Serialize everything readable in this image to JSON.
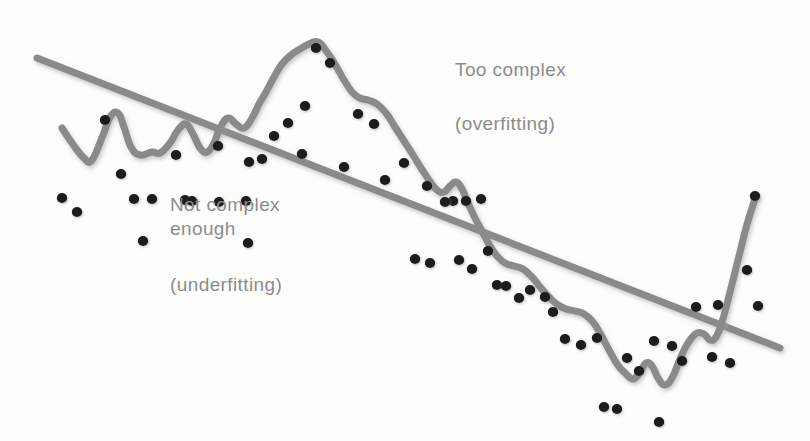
{
  "figure": {
    "background_color": "#fdfdfc"
  },
  "annotations": {
    "too_complex": "Too complex",
    "overfitting": "(overfitting)",
    "not_complex_enough_line1": "Not complex",
    "not_complex_enough_line2": "enough",
    "underfitting": "(underfitting)"
  },
  "style": {
    "curve_color": "#8a8a8a",
    "line_color": "#8a8a8a",
    "point_color": "#1a1a1a",
    "text_color": "#8c8c8c",
    "stroke_width": 7,
    "point_radius": 5.2
  },
  "chart_data": {
    "type": "scatter",
    "title": "",
    "xlabel": "",
    "ylabel": "",
    "xlim": [
      0,
      810
    ],
    "ylim": [
      441,
      0
    ],
    "grid": false,
    "legend": false,
    "axes_visible": false,
    "series": [
      {
        "name": "data points",
        "type": "scatter",
        "color": "#1a1a1a",
        "points": [
          [
            62,
            198
          ],
          [
            77,
            212
          ],
          [
            121,
            174
          ],
          [
            134,
            199
          ],
          [
            152,
            199
          ],
          [
            105,
            120
          ],
          [
            143,
            241
          ],
          [
            176,
            155
          ],
          [
            185,
            200
          ],
          [
            192,
            201
          ],
          [
            218,
            146
          ],
          [
            219,
            202
          ],
          [
            249,
            162
          ],
          [
            246,
            201
          ],
          [
            248,
            243
          ],
          [
            262,
            159
          ],
          [
            274,
            136
          ],
          [
            288,
            123
          ],
          [
            302,
            154
          ],
          [
            305,
            106
          ],
          [
            316,
            48
          ],
          [
            330,
            63
          ],
          [
            358,
            114
          ],
          [
            374,
            124
          ],
          [
            344,
            167
          ],
          [
            385,
            180
          ],
          [
            404,
            163
          ],
          [
            427,
            186
          ],
          [
            430,
            263
          ],
          [
            453,
            201
          ],
          [
            459,
            260
          ],
          [
            472,
            269
          ],
          [
            415,
            259
          ],
          [
            466,
            201
          ],
          [
            445,
            202
          ],
          [
            481,
            199
          ],
          [
            488,
            251
          ],
          [
            497,
            285
          ],
          [
            506,
            286
          ],
          [
            519,
            298
          ],
          [
            530,
            290
          ],
          [
            545,
            297
          ],
          [
            553,
            312
          ],
          [
            565,
            339
          ],
          [
            581,
            345
          ],
          [
            597,
            338
          ],
          [
            604,
            407
          ],
          [
            617,
            409
          ],
          [
            627,
            358
          ],
          [
            639,
            371
          ],
          [
            654,
            341
          ],
          [
            659,
            422
          ],
          [
            672,
            346
          ],
          [
            682,
            361
          ],
          [
            696,
            307
          ],
          [
            712,
            357
          ],
          [
            718,
            305
          ],
          [
            730,
            363
          ],
          [
            747,
            270
          ],
          [
            755,
            196
          ],
          [
            758,
            306
          ]
        ]
      },
      {
        "name": "underfit model (straight line)",
        "type": "line",
        "color": "#8a8a8a",
        "path": [
          [
            37,
            58
          ],
          [
            780,
            348
          ]
        ]
      },
      {
        "name": "overfit model (wiggly curve)",
        "type": "line",
        "color": "#8a8a8a",
        "path": [
          [
            62,
            128
          ],
          [
            72,
            143
          ],
          [
            84,
            158
          ],
          [
            92,
            160
          ],
          [
            103,
            135
          ],
          [
            110,
            117
          ],
          [
            118,
            113
          ],
          [
            124,
            127
          ],
          [
            131,
            147
          ],
          [
            140,
            155
          ],
          [
            152,
            152
          ],
          [
            160,
            153
          ],
          [
            170,
            143
          ],
          [
            178,
            130
          ],
          [
            186,
            124
          ],
          [
            193,
            134
          ],
          [
            200,
            148
          ],
          [
            207,
            152
          ],
          [
            214,
            143
          ],
          [
            220,
            128
          ],
          [
            228,
            118
          ],
          [
            236,
            124
          ],
          [
            244,
            128
          ],
          [
            252,
            118
          ],
          [
            259,
            104
          ],
          [
            266,
            92
          ],
          [
            274,
            77
          ],
          [
            282,
            64
          ],
          [
            291,
            55
          ],
          [
            300,
            49
          ],
          [
            309,
            44
          ],
          [
            318,
            42
          ],
          [
            327,
            52
          ],
          [
            336,
            66
          ],
          [
            344,
            80
          ],
          [
            352,
            92
          ],
          [
            360,
            98
          ],
          [
            368,
            100
          ],
          [
            377,
            104
          ],
          [
            386,
            113
          ],
          [
            395,
            127
          ],
          [
            404,
            141
          ],
          [
            413,
            155
          ],
          [
            421,
            168
          ],
          [
            429,
            180
          ],
          [
            437,
            190
          ],
          [
            444,
            192
          ],
          [
            450,
            186
          ],
          [
            456,
            182
          ],
          [
            462,
            189
          ],
          [
            468,
            203
          ],
          [
            475,
            218
          ],
          [
            483,
            233
          ],
          [
            490,
            246
          ],
          [
            497,
            256
          ],
          [
            505,
            263
          ],
          [
            514,
            266
          ],
          [
            523,
            269
          ],
          [
            532,
            277
          ],
          [
            541,
            288
          ],
          [
            550,
            298
          ],
          [
            558,
            305
          ],
          [
            566,
            309
          ],
          [
            575,
            311
          ],
          [
            584,
            314
          ],
          [
            593,
            322
          ],
          [
            601,
            335
          ],
          [
            609,
            350
          ],
          [
            617,
            364
          ],
          [
            625,
            373
          ],
          [
            633,
            379
          ],
          [
            640,
            372
          ],
          [
            646,
            363
          ],
          [
            652,
            366
          ],
          [
            658,
            378
          ],
          [
            665,
            385
          ],
          [
            672,
            378
          ],
          [
            678,
            364
          ],
          [
            684,
            350
          ],
          [
            690,
            340
          ],
          [
            697,
            333
          ],
          [
            704,
            334
          ],
          [
            710,
            340
          ],
          [
            716,
            337
          ],
          [
            722,
            322
          ],
          [
            728,
            300
          ],
          [
            734,
            276
          ],
          [
            740,
            252
          ],
          [
            746,
            228
          ],
          [
            752,
            208
          ],
          [
            756,
            196
          ]
        ]
      }
    ]
  }
}
